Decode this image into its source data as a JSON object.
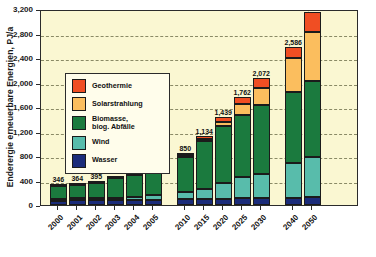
{
  "chart_data": {
    "type": "bar",
    "stacked": true,
    "title": "",
    "xlabel": "",
    "ylabel": "Enderergie erneuerbare Energien, PJ/a",
    "ylim": [
      0,
      3200
    ],
    "ytick_step": 400,
    "ytick_labels": [
      "0",
      "400",
      "800",
      "1,200",
      "1,600",
      "2,000",
      "2,400",
      "2,800",
      "3,200"
    ],
    "grid": true,
    "legend_position": "upper-left-inside",
    "categories": [
      "2000",
      "2001",
      "2002",
      "2003",
      "2004",
      "2005",
      "2010",
      "2015",
      "2020",
      "2025",
      "2030",
      "2040",
      "2050"
    ],
    "totals": [
      346,
      364,
      395,
      473,
      523,
      601,
      850,
      1134,
      1439,
      1762,
      2072,
      2586,
      3156
    ],
    "total_labels": [
      "346",
      "364",
      "395",
      "473",
      "523",
      "601",
      "850",
      "1,134",
      "1,439",
      "1,762",
      "2,072",
      "2,586",
      "3,156"
    ],
    "series": [
      {
        "name": "Wasser",
        "color": "#1B2C7A",
        "values": [
          82,
          84,
          86,
          88,
          90,
          92,
          96,
          100,
          104,
          108,
          112,
          118,
          124
        ]
      },
      {
        "name": "Wind",
        "color": "#58BCAB",
        "values": [
          8,
          14,
          22,
          38,
          54,
          78,
          122,
          168,
          250,
          344,
          394,
          560,
          660
        ]
      },
      {
        "name": "Biomasse, biog. Abfälle",
        "color": "#1B7A3E",
        "values": [
          252,
          262,
          283,
          343,
          374,
          426,
          620,
          770,
          930,
          1020,
          1120,
          1168,
          1240
        ]
      },
      {
        "name": "Solarstrahlung",
        "color": "#FBBE5E",
        "values": [
          4,
          4,
          4,
          4,
          5,
          5,
          8,
          40,
          68,
          170,
          280,
          560,
          800
        ]
      },
      {
        "name": "Geothermie",
        "color": "#F04E23",
        "values": [
          0,
          0,
          0,
          0,
          0,
          0,
          4,
          56,
          87,
          120,
          166,
          180,
          332
        ]
      }
    ],
    "legend_entries": [
      {
        "label": "Geothermie",
        "color": "#F04E23"
      },
      {
        "label": "Solarstrahlung",
        "color": "#FBBE5E"
      },
      {
        "label": "Biomasse,\nbiog. Abfälle",
        "color": "#1B7A3E"
      },
      {
        "label": "Wind",
        "color": "#58BCAB"
      },
      {
        "label": "Wasser",
        "color": "#1B2C7A"
      }
    ],
    "colors": {
      "plot_background": "#FAF7D2",
      "legend_background": "#FFFDEB",
      "axis": "#2b2b2b",
      "gridline": "#8a8a66"
    },
    "group_gaps_after": [
      "2005",
      "2030"
    ]
  }
}
